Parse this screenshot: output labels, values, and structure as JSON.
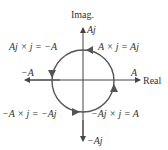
{
  "diagram": {
    "axes": {
      "imag_label": "Imag.",
      "real_label": "Real"
    },
    "points": {
      "pos_imag": "Aj",
      "neg_imag": "−Aj",
      "pos_real": "A",
      "neg_real": "−A"
    },
    "rotations": {
      "top_right": "A × j = Aj",
      "top_left": "Aj × j = −A",
      "bottom_left": "−A × j = −Aj",
      "bottom_right": "−Aj × j = A"
    },
    "colors": {
      "axis": "#444444",
      "circle": "#555555",
      "text": "#333333"
    }
  }
}
